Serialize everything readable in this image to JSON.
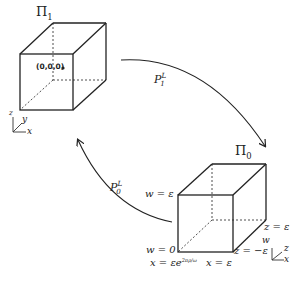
{
  "figure": {
    "top_cube": {
      "label": "Π",
      "label_sub": "1",
      "origin_label": "(0,0,0)",
      "axes": {
        "vertical": "z",
        "diagonal": "y",
        "horizontal": "x"
      }
    },
    "bottom_cube": {
      "label": "Π",
      "label_sub": "0",
      "labels": {
        "top_left": "w = ε",
        "bottom_left": "w = 0",
        "bottom_left_below": "x = εe",
        "bottom_left_below_exp": "2πρ/ω",
        "bottom_center": "x = ε",
        "bottom_right": "z = −ε",
        "right_mid": "z = ε"
      },
      "axes": {
        "vertical": "w",
        "diagonal": "z",
        "horizontal": "x"
      }
    },
    "arrows": [
      {
        "id": "p1",
        "label": "P",
        "sub": "1",
        "sup": "L",
        "from": "top_cube",
        "to": "bottom_cube"
      },
      {
        "id": "p0",
        "label": "P",
        "sub": "0",
        "sup": "L",
        "from": "bottom_cube",
        "to": "top_cube"
      }
    ]
  }
}
